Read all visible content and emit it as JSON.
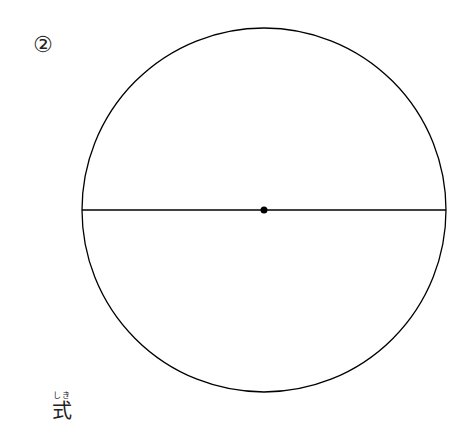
{
  "problem_number": "②",
  "circle": {
    "center_x": 264,
    "center_y": 210,
    "radius": 182,
    "stroke_color": "#000000"
  },
  "diameter_line": {
    "x1": 82,
    "y1": 210,
    "x2": 446,
    "y2": 210
  },
  "center_point": {
    "x": 264,
    "y": 210,
    "r": 3.5
  },
  "formula": {
    "ruby": "しき",
    "label": "式"
  }
}
